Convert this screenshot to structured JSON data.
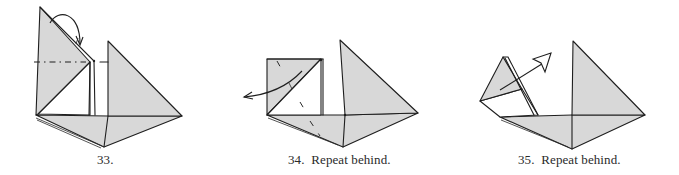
{
  "figure": {
    "steps": [
      {
        "number": "33.",
        "caption": "33.",
        "instruction": ""
      },
      {
        "number": "34.",
        "caption": "34.  Repeat behind.",
        "instruction": "Repeat behind."
      },
      {
        "number": "35.",
        "caption": "35.  Repeat behind.",
        "instruction": "Repeat behind."
      }
    ],
    "colors": {
      "paper_shade": "#d8d8d8",
      "line": "#1e1e1e",
      "background": "#ffffff"
    },
    "symbols": {
      "step_33": [
        "valley-fold-dash-dot-line",
        "fold-over-arc-arrow"
      ],
      "step_34": [
        "unfold-curved-arrow",
        "hidden-crease-dashes"
      ],
      "step_35": [
        "hollow-head-pull-arrow"
      ]
    }
  }
}
